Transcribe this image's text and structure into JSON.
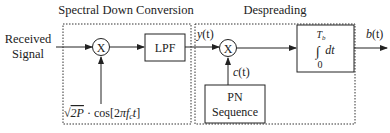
{
  "diagram": {
    "input_label_line1": "Received",
    "input_label_line2": "Signal",
    "group_spectral": {
      "title": "Spectral Down Conversion"
    },
    "group_despreading": {
      "title": "Despreading"
    },
    "mixer1": {
      "symbol": "X"
    },
    "mixer2": {
      "symbol": "X"
    },
    "lpf": {
      "label": "LPF"
    },
    "carrier": {
      "sqrt": "√",
      "amp": "2P",
      "dot": "·",
      "cos": "cos[2",
      "pi": "π",
      "f": "f",
      "sub": "c",
      "t": "t",
      "close": "]"
    },
    "signal_y": {
      "name": "y",
      "arg": "(t)"
    },
    "signal_c": {
      "name": "c",
      "arg": "(t)"
    },
    "pn": {
      "line1": "PN",
      "line2": "Sequence"
    },
    "integrator": {
      "upper": "T",
      "upper_sub": "b",
      "integral": "∫",
      "dt": "dt",
      "lower": "0"
    },
    "output": {
      "name": "b",
      "arg": "(t)"
    }
  },
  "colors": {
    "stroke": "#222222",
    "dash": "#333333",
    "background": "#ffffff"
  }
}
